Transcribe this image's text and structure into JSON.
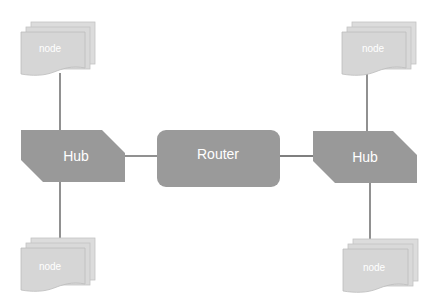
{
  "diagram": {
    "type": "network-topology",
    "colors": {
      "background": "#ffffff",
      "hub_fill": "#999999",
      "router_fill": "#9a9a9a",
      "node_fill": "#d9d9d9",
      "node_border": "#bdbdbd",
      "connector": "#555555",
      "label": "#ffffff"
    },
    "router": {
      "label": "Router"
    },
    "hubs": [
      {
        "id": "hub-left",
        "label": "Hub"
      },
      {
        "id": "hub-right",
        "label": "Hub"
      }
    ],
    "nodes": [
      {
        "id": "node-top-left",
        "label": "node",
        "connected_to": "hub-left"
      },
      {
        "id": "node-bottom-left",
        "label": "node",
        "connected_to": "hub-left"
      },
      {
        "id": "node-top-right",
        "label": "node",
        "connected_to": "hub-right"
      },
      {
        "id": "node-bottom-right",
        "label": "node",
        "connected_to": "hub-right"
      }
    ],
    "edges": [
      {
        "from": "hub-left",
        "to": "router"
      },
      {
        "from": "router",
        "to": "hub-right"
      },
      {
        "from": "node-top-left",
        "to": "hub-left"
      },
      {
        "from": "hub-left",
        "to": "node-bottom-left"
      },
      {
        "from": "node-top-right",
        "to": "hub-right"
      },
      {
        "from": "hub-right",
        "to": "node-bottom-right"
      }
    ]
  }
}
